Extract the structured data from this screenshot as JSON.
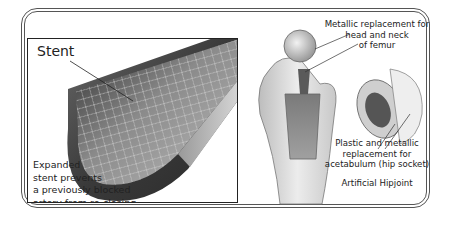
{
  "figure": {
    "stent_panel": {
      "title": "Stent",
      "caption_lines": [
        "Expanded",
        "stent prevents",
        "a previously blocked",
        "artery from re-closing"
      ]
    },
    "hip_panel": {
      "femur_label_lines": [
        "Metallic replacement for",
        "head and neck",
        "of femur"
      ],
      "acetabulum_label_lines": [
        "Plastic and metallic",
        "replacement for",
        "acetabulum (hip socket)"
      ],
      "title": "Artificial Hipjoint"
    }
  }
}
